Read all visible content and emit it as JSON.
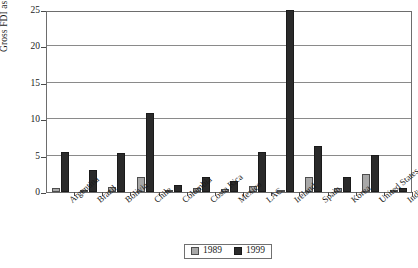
{
  "chart_data": {
    "type": "bar",
    "title": "",
    "xlabel": "",
    "ylabel": "Gross FDI as % of GDP (PPP)",
    "ylim": [
      0,
      25
    ],
    "yticks": [
      0,
      5,
      10,
      15,
      20,
      25
    ],
    "ytick_labels": [
      "0",
      "5",
      "10",
      "15",
      "20",
      "25"
    ],
    "grid": true,
    "legend_position": "bottom-center",
    "categories": [
      "Argentina",
      "Brazil",
      "Bolivia",
      "Chile",
      "Colombia",
      "Costa Rica",
      "Mexico",
      "LAC",
      "Ireland",
      "Spain",
      "Korea",
      "United States",
      "India"
    ],
    "series": [
      {
        "name": "1989",
        "color": "#a8a8a8",
        "values": [
          0.5,
          0.2,
          0.7,
          2.1,
          0.2,
          0.5,
          0.4,
          0.8,
          0.2,
          2.1,
          0.5,
          2.5,
          0.05
        ]
      },
      {
        "name": "1999",
        "color": "#2a2a2a",
        "values": [
          5.5,
          3.0,
          5.3,
          10.9,
          0.9,
          2.1,
          1.5,
          5.5,
          25.0,
          6.3,
          2.0,
          5.1,
          0.5
        ]
      }
    ]
  },
  "legend": {
    "items": [
      {
        "label": "1989",
        "swatch": "light-gray-square"
      },
      {
        "label": "1999",
        "swatch": "dark-square"
      }
    ]
  }
}
